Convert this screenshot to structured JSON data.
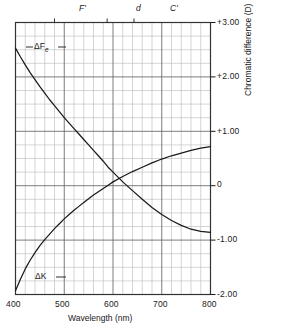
{
  "chart_data": {
    "type": "line",
    "title": "",
    "xlabel": "Wavelength (nm)",
    "ylabel": "Chromatic difference  (D)",
    "xlim": [
      400,
      800
    ],
    "ylim": [
      -2.0,
      3.0
    ],
    "xticks": [
      400,
      500,
      600,
      700,
      800
    ],
    "xtick_labels": [
      "400",
      "500",
      "600",
      "700",
      "800"
    ],
    "yticks": [
      3.0,
      2.0,
      1.0,
      0.0,
      -1.0,
      -2.0
    ],
    "ytick_labels": [
      "+3.00",
      "+2.00",
      "+1.00",
      "0",
      "-1.00",
      "-2.00"
    ],
    "grid": true,
    "grid_minor_x_step": 20,
    "grid_minor_y_step": 0.25,
    "legend_position": "inline-annotations",
    "annotations": [
      {
        "name": "F-prime-line",
        "label": "F′",
        "x": 480,
        "y_position": "top-axis"
      },
      {
        "name": "d-line",
        "label": "d",
        "x": 588,
        "y_position": "top-axis"
      },
      {
        "name": "C-prime-line",
        "label": "C′",
        "x": 643,
        "y_position": "top-axis"
      }
    ],
    "series": [
      {
        "name": "ΔF_e",
        "label_text": "ΔF",
        "label_subscript": "e",
        "color": "#1a1a1a",
        "points": [
          [
            400,
            2.53
          ],
          [
            410,
            2.37
          ],
          [
            420,
            2.22
          ],
          [
            430,
            2.08
          ],
          [
            440,
            1.95
          ],
          [
            450,
            1.82
          ],
          [
            460,
            1.7
          ],
          [
            470,
            1.58
          ],
          [
            480,
            1.47
          ],
          [
            490,
            1.36
          ],
          [
            500,
            1.25
          ],
          [
            510,
            1.15
          ],
          [
            520,
            1.05
          ],
          [
            530,
            0.95
          ],
          [
            540,
            0.85
          ],
          [
            550,
            0.75
          ],
          [
            560,
            0.65
          ],
          [
            570,
            0.55
          ],
          [
            580,
            0.45
          ],
          [
            590,
            0.34
          ],
          [
            600,
            0.25
          ],
          [
            620,
            0.07
          ],
          [
            640,
            -0.09
          ],
          [
            660,
            -0.25
          ],
          [
            680,
            -0.4
          ],
          [
            700,
            -0.53
          ],
          [
            720,
            -0.64
          ],
          [
            740,
            -0.73
          ],
          [
            760,
            -0.8
          ],
          [
            780,
            -0.84
          ],
          [
            800,
            -0.86
          ]
        ]
      },
      {
        "name": "ΔK",
        "label_text": "ΔK",
        "color": "#1a1a1a",
        "points": [
          [
            400,
            -1.93
          ],
          [
            410,
            -1.72
          ],
          [
            420,
            -1.53
          ],
          [
            430,
            -1.37
          ],
          [
            440,
            -1.23
          ],
          [
            450,
            -1.1
          ],
          [
            460,
            -0.99
          ],
          [
            470,
            -0.89
          ],
          [
            480,
            -0.79
          ],
          [
            490,
            -0.7
          ],
          [
            500,
            -0.61
          ],
          [
            510,
            -0.53
          ],
          [
            520,
            -0.45
          ],
          [
            530,
            -0.38
          ],
          [
            540,
            -0.31
          ],
          [
            550,
            -0.24
          ],
          [
            560,
            -0.17
          ],
          [
            570,
            -0.11
          ],
          [
            580,
            -0.05
          ],
          [
            590,
            0.01
          ],
          [
            600,
            0.07
          ],
          [
            620,
            0.17
          ],
          [
            640,
            0.26
          ],
          [
            660,
            0.34
          ],
          [
            680,
            0.42
          ],
          [
            700,
            0.49
          ],
          [
            720,
            0.55
          ],
          [
            740,
            0.6
          ],
          [
            760,
            0.65
          ],
          [
            780,
            0.69
          ],
          [
            800,
            0.72
          ]
        ]
      }
    ],
    "crossing_point": {
      "x": 588,
      "y": 0.0
    }
  },
  "axis": {
    "x_title": "Wavelength (nm)",
    "y_title": "Chromatic difference  (D)",
    "x_ticks": [
      "400",
      "500",
      "600",
      "700",
      "800"
    ],
    "y_ticks": [
      "+3.00",
      "+2.00",
      "+1.00",
      "0",
      "-1.00",
      "-2.00"
    ]
  },
  "spectral_lines": {
    "f_prime": "F′",
    "d": "d",
    "c_prime": "C′"
  },
  "curve_labels": {
    "delta_f_e_main": "ΔF",
    "delta_f_e_sub": "e",
    "delta_k": "ΔK"
  },
  "colors": {
    "curve": "#1a1a1a",
    "axis": "#1a1a1a",
    "grid_major": "#6e6e6e",
    "grid_minor": "#b8b8b8",
    "background": "#ffffff"
  }
}
